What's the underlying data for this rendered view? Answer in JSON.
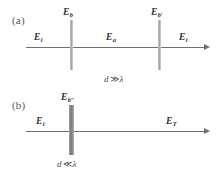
{
  "figure": {
    "panels": [
      {
        "tag": "(a)",
        "condition": "d",
        "condition_op": "≫",
        "condition_lambda": "λ",
        "labels": {
          "slab_left": "E",
          "slab_left_sub": "b",
          "slab_right": "E",
          "slab_right_sub": "b′",
          "incident": "E",
          "incident_sub": "i",
          "middle": "E",
          "middle_sub": "a",
          "transmitted": "E",
          "transmitted_sub": "t"
        }
      },
      {
        "tag": "(b)",
        "condition": "d",
        "condition_op": "≪",
        "condition_lambda": "λ",
        "labels": {
          "slab": "E",
          "slab_sub": "b″",
          "incident": "E",
          "incident_sub": "i",
          "transmitted": "E",
          "transmitted_sub": "T"
        }
      }
    ],
    "colors": {
      "axis": "#6e6f72",
      "slab_thin": "#9d9ea1",
      "slab_thick": "#77787b",
      "text": "#2d2d30",
      "tag_text": "#58585a"
    }
  }
}
